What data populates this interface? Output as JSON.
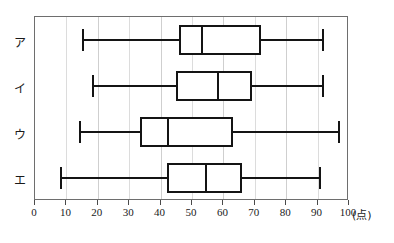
{
  "chart_data": {
    "type": "box",
    "title": "",
    "xlabel": "(点)",
    "ylabel": "",
    "xlim": [
      0,
      100
    ],
    "grid": true,
    "legend": "none",
    "orientation": "horizontal",
    "xticks": [
      0,
      10,
      20,
      30,
      40,
      50,
      60,
      70,
      80,
      90,
      100
    ],
    "xtick_labels": [
      "0",
      "10",
      "20",
      "30",
      "40",
      "50",
      "60",
      "70",
      "80",
      "90",
      "100"
    ],
    "categories": [
      "ア",
      "イ",
      "ウ",
      "エ"
    ],
    "boxes": [
      {
        "label": "ア",
        "min": 15,
        "q1": 46,
        "median": 53,
        "q3": 72,
        "max": 92
      },
      {
        "label": "イ",
        "min": 18,
        "q1": 45,
        "median": 58,
        "q3": 69,
        "max": 92
      },
      {
        "label": "ウ",
        "min": 14,
        "q1": 33.5,
        "median": 42,
        "q3": 63,
        "max": 97
      },
      {
        "label": "エ",
        "min": 8,
        "q1": 42,
        "median": 54,
        "q3": 66,
        "max": 91
      }
    ]
  },
  "axis": {
    "unit_label": "(点)"
  },
  "colors": {
    "stroke": "#141414",
    "frame": "#6e6e6e",
    "grid": "#cfcfcf",
    "background": "#ffffff"
  }
}
